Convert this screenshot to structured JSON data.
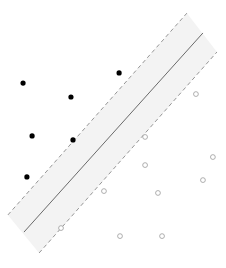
{
  "diagram": {
    "type": "svm-maximum-margin",
    "axes_visible": false,
    "coordinate_range": {
      "x": [
        0,
        10
      ],
      "y": [
        0,
        10
      ]
    },
    "colors": {
      "positive_class": "#000000",
      "negative_class_stroke": "#9a9a9a",
      "negative_class_fill": "#ffffff",
      "margin_band": "#f3f3f3",
      "hyperplane": "#6a6a6a",
      "margin_lines": "#8a8a8a"
    },
    "hyperplane": {
      "from": [
        1.06,
        1.34
      ],
      "to": [
        8.98,
        8.77
      ]
    },
    "margin_upper": {
      "from": [
        0.35,
        1.98
      ],
      "to": [
        8.27,
        9.51
      ]
    },
    "margin_lower": {
      "from": [
        1.73,
        0.56
      ],
      "to": [
        9.6,
        8.06
      ]
    },
    "classes": [
      {
        "name": "filled",
        "marker": "filled-circle",
        "points": [
          [
            1.02,
            6.9
          ],
          [
            3.14,
            6.38
          ],
          [
            5.27,
            7.28
          ],
          [
            1.42,
            4.93
          ],
          [
            3.23,
            4.78
          ],
          [
            1.19,
            3.4
          ]
        ]
      },
      {
        "name": "hollow",
        "marker": "open-circle",
        "points": [
          [
            8.67,
            6.49
          ],
          [
            6.42,
            4.89
          ],
          [
            6.42,
            3.84
          ],
          [
            9.42,
            4.14
          ],
          [
            8.98,
            3.28
          ],
          [
            6.99,
            2.8
          ],
          [
            4.6,
            2.87
          ],
          [
            2.7,
            1.49
          ],
          [
            5.31,
            1.19
          ],
          [
            7.17,
            1.19
          ]
        ]
      }
    ]
  }
}
